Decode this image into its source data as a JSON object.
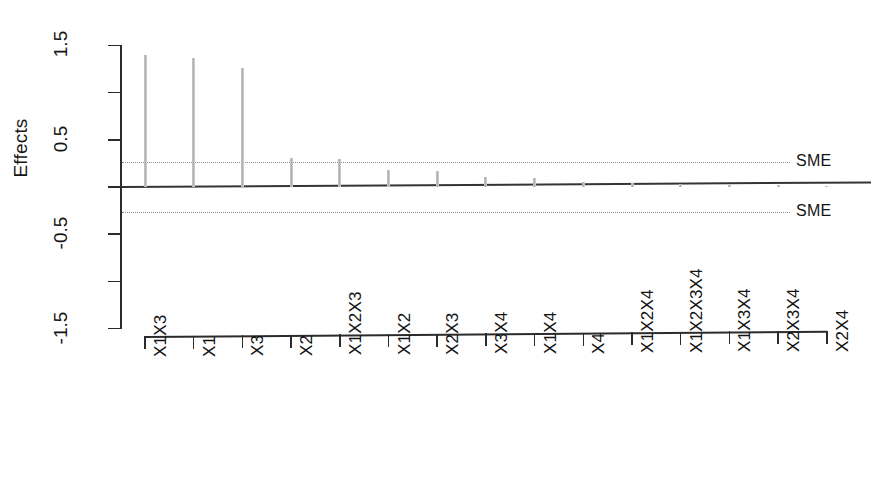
{
  "chart_data": {
    "type": "bar",
    "title": "",
    "xlabel": "",
    "ylabel": "Effects",
    "ylim": [
      -1.5,
      1.5
    ],
    "grid": false,
    "legend_position": "right-inline",
    "y_ticks_major": [
      "1.5",
      "0.5",
      "-0.5",
      "-1.5"
    ],
    "y_tick_values_major": [
      1.5,
      0.5,
      -0.5,
      -1.5
    ],
    "y_tick_values_minor": [
      1.0,
      0.0,
      -1.0
    ],
    "categories": [
      "X1X3",
      "X1",
      "X3",
      "X2",
      "X1X2X3",
      "X1X2",
      "X2X3",
      "X3X4",
      "X1X4",
      "X4",
      "X1X2X4",
      "X1X2X3X4",
      "X1X3X4",
      "X2X3X4",
      "X2X4"
    ],
    "values": [
      1.4,
      1.37,
      1.26,
      0.31,
      0.3,
      0.18,
      0.17,
      0.11,
      0.1,
      0.05,
      0.04,
      0.03,
      0.02,
      0.02,
      0.01
    ],
    "annotations": [
      {
        "label": "SME",
        "y": 0.27,
        "style": "dotted-line"
      },
      {
        "label": "SME",
        "y": -0.27,
        "style": "dotted-line"
      }
    ],
    "reference_lines": [
      {
        "label": "zero",
        "y": 0.0,
        "style": "solid"
      }
    ],
    "colors": {
      "bar": "#b9b9b9",
      "axis": "#2b2b2b",
      "zero_line": "#343434",
      "sme_line": "#8d8d8d",
      "text": "#151515",
      "background": "#ffffff"
    }
  }
}
